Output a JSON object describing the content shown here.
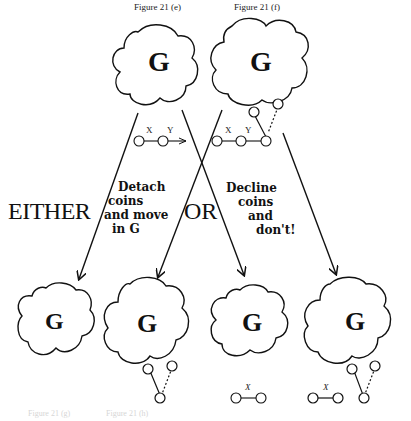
{
  "captions": {
    "top_left": "Figure 21 (e)",
    "top_right": "Figure 21 (f)",
    "bottom_left": "Figure 21 (g)",
    "bottom_right": "Figure 21 (h)"
  },
  "labels": {
    "either": "EITHER",
    "or": "OR",
    "option_1": [
      "Detach",
      "coins",
      "and move",
      "in G"
    ],
    "option_2": [
      "Decline",
      "coins",
      "and",
      "don't!"
    ]
  },
  "clouds": [
    {
      "id": "e",
      "letter": "G"
    },
    {
      "id": "f",
      "letter": "G"
    },
    {
      "id": "g-left",
      "letter": "G"
    },
    {
      "id": "g-right",
      "letter": "G"
    },
    {
      "id": "h-left",
      "letter": "G"
    },
    {
      "id": "h-right",
      "letter": "G"
    }
  ],
  "coin_labels": {
    "x": "X",
    "y": "Y"
  },
  "colors": {
    "ink": "#111111",
    "background": "#ffffff"
  }
}
